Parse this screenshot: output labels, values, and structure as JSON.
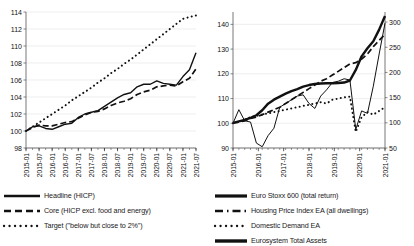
{
  "chart_data": [
    {
      "id": "inflation",
      "type": "line",
      "title": "",
      "xlabel": "",
      "ylabel": "",
      "ylim": [
        98,
        114
      ],
      "yticks": [
        98,
        100,
        102,
        104,
        106,
        108,
        110,
        112,
        114
      ],
      "grid": true,
      "legend_position": "bottom",
      "xticks": [
        "2015-01",
        "2015-07",
        "2016-01",
        "2016-07",
        "2017-01",
        "2017-07",
        "2018-01",
        "2018-07",
        "2019-01",
        "2019-07",
        "2020-01",
        "2020-07",
        "2021-01",
        "2021-07"
      ],
      "x": [
        "2015-01",
        "2015-04",
        "2015-07",
        "2015-10",
        "2016-01",
        "2016-04",
        "2016-07",
        "2016-10",
        "2017-01",
        "2017-04",
        "2017-07",
        "2017-10",
        "2018-01",
        "2018-04",
        "2018-07",
        "2018-10",
        "2019-01",
        "2019-04",
        "2019-07",
        "2019-10",
        "2020-01",
        "2020-04",
        "2020-07",
        "2020-10",
        "2021-01",
        "2021-04",
        "2021-07"
      ],
      "series": [
        {
          "name": "Headline (HICP)",
          "style": "solid",
          "values": [
            100.0,
            100.5,
            100.6,
            100.3,
            100.2,
            100.5,
            100.8,
            100.9,
            101.6,
            102.0,
            102.2,
            102.4,
            102.9,
            103.4,
            103.9,
            104.3,
            104.5,
            105.2,
            105.5,
            105.5,
            105.9,
            105.6,
            105.5,
            105.4,
            106.4,
            107.2,
            109.2
          ]
        },
        {
          "name": "Core (HICP excl. food and energy)",
          "style": "dashed",
          "values": [
            100.0,
            100.4,
            100.7,
            100.6,
            100.6,
            100.8,
            101.0,
            101.1,
            101.5,
            101.9,
            102.2,
            102.3,
            102.6,
            103.0,
            103.3,
            103.5,
            103.8,
            104.3,
            104.6,
            104.8,
            105.2,
            105.3,
            105.4,
            105.3,
            105.8,
            106.2,
            107.3
          ]
        },
        {
          "name": "Target (\"below but close to 2%\")",
          "style": "dotted",
          "values": [
            100.0,
            100.5,
            101.0,
            101.5,
            102.0,
            102.5,
            103.0,
            103.6,
            104.1,
            104.6,
            105.1,
            105.7,
            106.2,
            106.8,
            107.3,
            107.9,
            108.4,
            109.0,
            109.6,
            110.2,
            110.8,
            111.4,
            112.0,
            112.6,
            113.2,
            113.4,
            113.6
          ]
        }
      ]
    },
    {
      "id": "assets",
      "type": "line",
      "title": "",
      "xlabel": "",
      "ylabel": "",
      "ylim": [
        90,
        145
      ],
      "yticks": [
        90,
        100,
        110,
        120,
        130,
        140
      ],
      "y2lim": [
        50,
        320
      ],
      "y2ticks": [
        50,
        100,
        150,
        200,
        250,
        300
      ],
      "grid": true,
      "legend_position": "bottom",
      "xticks": [
        "2015-01",
        "2016-01",
        "2017-01",
        "2018-01",
        "2019-01",
        "2020-01",
        "2021-01"
      ],
      "x": [
        "2015-01",
        "2015-04",
        "2015-07",
        "2015-10",
        "2016-01",
        "2016-04",
        "2016-07",
        "2016-10",
        "2017-01",
        "2017-04",
        "2017-07",
        "2017-10",
        "2018-01",
        "2018-04",
        "2018-07",
        "2018-10",
        "2019-01",
        "2019-04",
        "2019-07",
        "2019-10",
        "2020-01",
        "2020-04",
        "2020-07",
        "2020-10",
        "2021-01",
        "2021-04",
        "2021-07"
      ],
      "series": [
        {
          "name": "Euro Stoxx 600 (total return)",
          "style": "thin-solid",
          "axis": "left",
          "values": [
            100.0,
            105.5,
            101.0,
            100.5,
            92.0,
            90.5,
            95.0,
            98.0,
            106.5,
            108.0,
            109.5,
            111.0,
            111.5,
            108.0,
            106.0,
            111.0,
            113.5,
            116.5,
            117.0,
            118.0,
            117.5,
            97.5,
            105.0,
            104.0,
            115.0,
            128.0,
            140.5
          ]
        },
        {
          "name": "Housing Price Index EA (all dwellings)",
          "style": "dashed",
          "axis": "left",
          "values": [
            100.0,
            100.5,
            101.0,
            102.0,
            102.5,
            103.5,
            104.5,
            105.5,
            106.5,
            108.0,
            109.5,
            111.0,
            112.5,
            114.0,
            115.5,
            117.0,
            118.0,
            119.5,
            121.0,
            122.5,
            124.0,
            124.5,
            126.0,
            128.0,
            131.0,
            133.5,
            136.0
          ]
        },
        {
          "name": "Domestic Demand EA",
          "style": "dotted",
          "axis": "left",
          "values": [
            100.0,
            100.5,
            101.5,
            102.5,
            103.0,
            103.5,
            104.0,
            104.5,
            105.0,
            105.5,
            106.0,
            106.5,
            107.0,
            107.5,
            108.0,
            108.5,
            108.0,
            109.5,
            110.0,
            110.5,
            110.8,
            96.5,
            102.5,
            104.5,
            103.5,
            105.0,
            106.5
          ]
        },
        {
          "name": "Eurosystem Total Assets",
          "style": "thick-solid",
          "axis": "right",
          "values": [
            100.0,
            103.0,
            106.0,
            110.0,
            115.0,
            125.0,
            138.0,
            146.0,
            152.0,
            158.0,
            163.0,
            167.0,
            172.0,
            175.0,
            177.0,
            178.0,
            178.5,
            178.5,
            179.0,
            180.0,
            184.0,
            205.0,
            232.0,
            248.0,
            262.0,
            285.0,
            312.0
          ]
        }
      ]
    }
  ]
}
